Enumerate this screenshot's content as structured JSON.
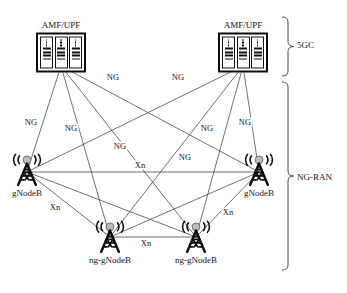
{
  "diagram": {
    "canvas": {
      "width": 347,
      "height": 293
    },
    "colors": {
      "line": "#4a4a4a",
      "icon": "#0d0d0d",
      "text": "#141414",
      "background": "#ffffff"
    }
  },
  "nodes": {
    "core": [
      {
        "id": "amf-upf-left",
        "label": "AMF/UPF",
        "icon": "server-rack-icon",
        "x": 61,
        "y": 46
      },
      {
        "id": "amf-upf-right",
        "label": "AMF/UPF",
        "icon": "server-rack-icon",
        "x": 243,
        "y": 46
      }
    ],
    "ran": [
      {
        "id": "gnodeb-left",
        "label": "gNodeB",
        "icon": "cell-tower-icon",
        "x": 27,
        "y": 172
      },
      {
        "id": "gnodeb-right",
        "label": "gNodeB",
        "icon": "cell-tower-icon",
        "x": 259,
        "y": 172
      },
      {
        "id": "ng-gnodeb-left",
        "label": "ng-gNodeB",
        "icon": "cell-tower-icon",
        "x": 110,
        "y": 239
      },
      {
        "id": "ng-gnodeb-right",
        "label": "ng-gNodeB",
        "icon": "cell-tower-icon",
        "x": 196,
        "y": 239
      }
    ]
  },
  "links": {
    "ng": [
      {
        "from": "amf-upf-left",
        "to": "gnodeb-left"
      },
      {
        "from": "amf-upf-left",
        "to": "gnodeb-right"
      },
      {
        "from": "amf-upf-left",
        "to": "ng-gnodeb-left"
      },
      {
        "from": "amf-upf-left",
        "to": "ng-gnodeb-right"
      },
      {
        "from": "amf-upf-right",
        "to": "gnodeb-left"
      },
      {
        "from": "amf-upf-right",
        "to": "gnodeb-right"
      },
      {
        "from": "amf-upf-right",
        "to": "ng-gnodeb-left"
      },
      {
        "from": "amf-upf-right",
        "to": "ng-gnodeb-right"
      }
    ],
    "xn": [
      {
        "from": "gnodeb-left",
        "to": "gnodeb-right"
      },
      {
        "from": "gnodeb-left",
        "to": "ng-gnodeb-left"
      },
      {
        "from": "gnodeb-left",
        "to": "ng-gnodeb-right"
      },
      {
        "from": "gnodeb-right",
        "to": "ng-gnodeb-left"
      },
      {
        "from": "gnodeb-right",
        "to": "ng-gnodeb-right"
      },
      {
        "from": "ng-gnodeb-left",
        "to": "ng-gnodeb-right"
      }
    ]
  },
  "link_labels": [
    {
      "id": "ng-1",
      "text": "NG",
      "x": 113,
      "y": 77
    },
    {
      "id": "ng-2",
      "text": "NG",
      "x": 178,
      "y": 77
    },
    {
      "id": "ng-3",
      "text": "NG",
      "x": 31,
      "y": 122
    },
    {
      "id": "ng-4",
      "text": "NG",
      "x": 71,
      "y": 128
    },
    {
      "id": "ng-5",
      "text": "NG",
      "x": 207,
      "y": 128
    },
    {
      "id": "ng-6",
      "text": "NG",
      "x": 245,
      "y": 122
    },
    {
      "id": "ng-7",
      "text": "NG",
      "x": 120,
      "y": 146
    },
    {
      "id": "ng-8",
      "text": "NG",
      "x": 185,
      "y": 157
    },
    {
      "id": "xn-1",
      "text": "Xn",
      "x": 140,
      "y": 165
    },
    {
      "id": "xn-2",
      "text": "Xn",
      "x": 55,
      "y": 207
    },
    {
      "id": "xn-3",
      "text": "Xn",
      "x": 228,
      "y": 212
    },
    {
      "id": "xn-4",
      "text": "Xn",
      "x": 146,
      "y": 243
    }
  ],
  "regions": [
    {
      "id": "region-5gc",
      "label": "5GC",
      "x": 297,
      "y": 45,
      "brace_top": 17,
      "brace_bottom": 76
    },
    {
      "id": "region-ng-ran",
      "label": "NG-RAN",
      "x": 297,
      "y": 177,
      "brace_top": 82,
      "brace_bottom": 270
    }
  ]
}
